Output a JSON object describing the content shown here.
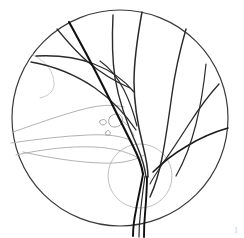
{
  "figure": {
    "background_color": "#ffffff",
    "corner_mark": "1"
  },
  "field": {
    "name": "fundus-field-outline",
    "shape": "circle",
    "center_x": 120,
    "center_y": 118,
    "radius": 108,
    "stroke_color": "#3a3a3a",
    "stroke_width": 1.2,
    "fill": "none"
  },
  "optic_disc": {
    "name": "optic-disc",
    "shape": "circle",
    "center_x": 140,
    "center_y": 176,
    "radius": 32,
    "stroke_color": "#b9b9b9",
    "stroke_width": 0.9,
    "fill": "none"
  },
  "peripheral_arc": {
    "name": "peripheral-arc",
    "stroke_color": "#c4c4c4",
    "stroke_width": 0.9,
    "path": "M 33 55 C 47 62 54 72 54 84 C 54 91 49 96 40 98"
  },
  "colors": {
    "vessel_dark": "#111111",
    "vessel_mid": "#3a3a3a",
    "vessel_faint": "#a9a9a9",
    "lesion": "#8f8f8f",
    "disc": "#b9b9b9",
    "background": "#ffffff"
  },
  "vessels": {
    "major": [
      {
        "name": "vessel-superotemporal-main",
        "stroke": "#111111",
        "width": 2.1,
        "path": "M 69 22 C 80 42 92 64 104 88 C 114 108 124 128 133 146 C 139 158 142 166 143 174"
      },
      {
        "name": "vessel-superonasal-main",
        "stroke": "#2a2a2a",
        "width": 1.5,
        "path": "M 142 12 C 138 34 134 58 134 82 C 134 104 138 126 143 146 C 146 158 148 168 148 177"
      },
      {
        "name": "vessel-superior-arcade-upper",
        "stroke": "#2a2a2a",
        "width": 1.4,
        "path": "M 113 15 C 112 36 112 58 115 78 C 119 102 128 126 137 146 C 142 158 145 168 146 177"
      },
      {
        "name": "vessel-inferior-trunk-left",
        "stroke": "#111111",
        "width": 1.9,
        "path": "M 143 174 C 141 186 138 198 136 210 C 134 220 133 228 133 236"
      },
      {
        "name": "vessel-inferior-trunk-right",
        "stroke": "#111111",
        "width": 1.9,
        "path": "M 147 177 C 147 190 146 202 145 214 C 144 224 144 231 144 237"
      },
      {
        "name": "vessel-inferior-trunk-center",
        "stroke": "#2a2a2a",
        "width": 1.2,
        "path": "M 145 176 C 143 190 141 204 140 218 C 139 227 139 233 139 237"
      }
    ],
    "temporal_branches": [
      {
        "name": "vessel-temporal-upper-branch",
        "stroke": "#2a2a2a",
        "width": 1.3,
        "path": "M 36 56 C 56 55 76 57 94 64 C 110 70 124 80 134 92"
      },
      {
        "name": "vessel-temporal-mid-branch",
        "stroke": "#2a2a2a",
        "width": 1.3,
        "path": "M 31 62 C 54 66 76 75 95 88 C 112 100 126 115 136 130"
      },
      {
        "name": "vessel-temporal-arch-branch",
        "stroke": "#2a2a2a",
        "width": 1.2,
        "path": "M 57 29 C 66 40 76 52 88 62 C 101 73 116 82 130 88"
      },
      {
        "name": "vessel-temporal-lower-arch",
        "stroke": "#2a2a2a",
        "width": 1.2,
        "path": "M 100 61 C 110 68 118 78 124 90 C 130 102 134 114 137 126"
      }
    ],
    "nasal_branches": [
      {
        "name": "vessel-nasal-superior-arcade",
        "stroke": "#2a2a2a",
        "width": 1.4,
        "path": "M 186 29 C 180 50 175 72 172 94 C 169 116 166 138 162 158 C 159 173 155 186 150 197"
      },
      {
        "name": "vessel-nasal-lateral-arcade",
        "stroke": "#2a2a2a",
        "width": 1.3,
        "path": "M 219 84 C 208 96 198 110 189 124 C 180 138 171 152 163 163"
      },
      {
        "name": "vessel-nasal-inferior-branch",
        "stroke": "#1a1a1a",
        "width": 1.5,
        "path": "M 228 128 C 214 132 200 138 187 146 C 175 153 163 162 153 172"
      },
      {
        "name": "vessel-nasal-far-branch",
        "stroke": "#2a2a2a",
        "width": 1.2,
        "path": "M 206 64 C 204 84 201 104 196 124 C 191 144 184 162 176 176"
      },
      {
        "name": "vessel-nasal-lower-connector",
        "stroke": "#2a2a2a",
        "width": 1.1,
        "path": "M 165 160 C 160 168 154 176 150 184"
      }
    ],
    "faint": [
      {
        "name": "vessel-faint-macular-upper",
        "stroke": "#a9a9a9",
        "width": 0.9,
        "path": "M 13 132 C 36 124 58 116 80 110 C 98 105 112 104 124 107"
      },
      {
        "name": "vessel-faint-macular-lower",
        "stroke": "#a9a9a9",
        "width": 0.9,
        "path": "M 11 143 C 38 139 64 136 88 135 C 108 134 122 136 132 141"
      },
      {
        "name": "vessel-faint-inferior-sweep",
        "stroke": "#a9a9a9",
        "width": 0.9,
        "path": "M 16 155 C 44 149 70 146 94 147 C 116 148 132 153 143 161"
      },
      {
        "name": "vessel-faint-inferior-long",
        "stroke": "#a9a9a9",
        "width": 0.9,
        "path": "M 23 152 C 50 158 76 162 100 163 C 120 164 134 161 144 155"
      },
      {
        "name": "vessel-faint-disc-hook",
        "stroke": "#a9a9a9",
        "width": 0.9,
        "path": "M 118 118 C 125 122 131 128 134 136"
      }
    ]
  },
  "lesions": [
    {
      "name": "lesion-exudate-large",
      "stroke": "#8b8b8b",
      "width": 0.8,
      "path": "M 110 117 C 113 114 117 113 120 115 C 123 117 123 121 121 124 C 119 127 114 128 111 126 C 108 124 108 119 110 117 Z"
    },
    {
      "name": "lesion-exudate-small",
      "stroke": "#8b8b8b",
      "width": 0.8,
      "path": "M 100 121 C 102 119 105 119 106 121 C 107 123 105 125 103 125 C 101 125 99 123 100 121 Z"
    },
    {
      "name": "lesion-exudate-dot",
      "stroke": "#8b8b8b",
      "width": 0.8,
      "path": "M 106 132 C 107 130 109 130 110 132 C 111 134 109 136 107 135 C 105 135 105 133 106 132 Z"
    }
  ]
}
